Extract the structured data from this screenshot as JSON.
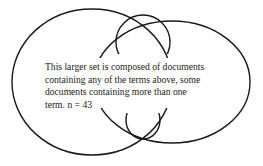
{
  "diagram": {
    "type": "venn",
    "caption": "This larger set is composed of documents\ncontaining any of the terms above, some\ndocuments containing more than one\nterm.  n = 43",
    "n": 43,
    "stroke_color": "#1a1a1a"
  }
}
